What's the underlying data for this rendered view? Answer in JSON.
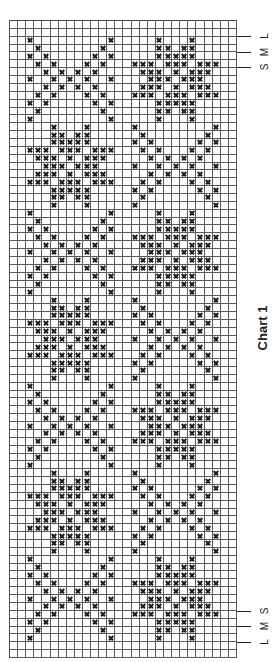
{
  "chart_data": {
    "type": "table",
    "title": "Chart 1",
    "grid": {
      "columns": 28,
      "rows": 81,
      "gridlines": true
    },
    "symbol": "x",
    "symbol_color": "#1e1e1e",
    "grid_color": "#5a5a5a",
    "size_markers": {
      "top": [
        {
          "label": "L",
          "row_boundary": 2
        },
        {
          "label": "M",
          "row_boundary": 4
        },
        {
          "label": "S",
          "row_boundary": 6
        }
      ],
      "bottom": [
        {
          "label": "S",
          "row_boundary": 75
        },
        {
          "label": "M",
          "row_boundary": 77
        },
        {
          "label": "L",
          "row_boundary": 79
        }
      ]
    },
    "motifs": {
      "lattice": [
        [
          0,
          10
        ],
        [
          1,
          9
        ],
        [
          0,
          2,
          8,
          10
        ],
        [
          1,
          3,
          7,
          9
        ],
        [
          2,
          4,
          6,
          8
        ],
        [
          0,
          3,
          5,
          7,
          10
        ],
        [
          2,
          4,
          6,
          8
        ],
        [
          1,
          3,
          7,
          9
        ],
        [
          0,
          2,
          8,
          10
        ],
        [
          1,
          9
        ],
        [
          0,
          10
        ]
      ],
      "star": [
        [
          3,
          7
        ],
        [
          3,
          4,
          6,
          7
        ],
        [
          3,
          4,
          5,
          6,
          7
        ],
        [
          0,
          1,
          2,
          4,
          5,
          6,
          8,
          9,
          10
        ],
        [
          1,
          2,
          3,
          5,
          7,
          8,
          9
        ],
        [
          2,
          3,
          4,
          6,
          7,
          8
        ],
        [
          1,
          2,
          3,
          5,
          7,
          8,
          9
        ],
        [
          0,
          1,
          2,
          4,
          5,
          6,
          8,
          9,
          10
        ],
        [
          3,
          4,
          5,
          6,
          7
        ],
        [
          3,
          4,
          6,
          7
        ],
        [
          3,
          7
        ]
      ]
    },
    "blocks": [
      {
        "start_row": 2,
        "left": "lattice",
        "right": "star"
      },
      {
        "start_row": 13,
        "left": "star",
        "right": "lattice"
      },
      {
        "start_row": 24,
        "left": "lattice",
        "right": "star"
      },
      {
        "start_row": 35,
        "left": "star",
        "right": "lattice"
      },
      {
        "start_row": 46,
        "left": "lattice",
        "right": "star"
      },
      {
        "start_row": 57,
        "left": "star",
        "right": "lattice"
      },
      {
        "start_row": 68,
        "left": "lattice",
        "right": "star"
      }
    ],
    "motif_left_col": 2,
    "motif_right_col": 15,
    "rows_marked": {
      "block_lattice_left": [
        [
          2,
          12,
          18,
          22
        ],
        [
          3,
          11,
          18,
          19,
          21,
          22
        ],
        [
          2,
          4,
          10,
          12,
          18,
          19,
          20,
          21,
          22
        ],
        [
          3,
          5,
          9,
          11,
          15,
          16,
          17,
          19,
          20,
          21,
          23,
          24,
          25
        ],
        [
          4,
          6,
          8,
          10,
          16,
          17,
          18,
          20,
          22,
          23,
          24
        ],
        [
          2,
          5,
          7,
          9,
          12,
          17,
          18,
          19,
          21,
          22,
          23
        ],
        [
          4,
          6,
          8,
          10,
          16,
          17,
          18,
          20,
          22,
          23,
          24
        ],
        [
          3,
          5,
          9,
          11,
          15,
          16,
          17,
          19,
          20,
          21,
          23,
          24,
          25
        ],
        [
          2,
          4,
          10,
          12,
          18,
          19,
          20,
          21,
          22
        ],
        [
          3,
          11,
          18,
          19,
          21,
          22
        ],
        [
          2,
          12,
          18,
          22
        ]
      ],
      "block_star_left": [
        [
          5,
          9,
          15,
          25
        ],
        [
          5,
          6,
          8,
          9,
          16,
          24
        ],
        [
          5,
          6,
          7,
          8,
          9,
          15,
          17,
          23,
          25
        ],
        [
          2,
          3,
          4,
          6,
          7,
          8,
          10,
          11,
          12,
          16,
          18,
          22,
          24
        ],
        [
          3,
          4,
          5,
          7,
          9,
          10,
          11,
          17,
          19,
          21,
          23
        ],
        [
          4,
          5,
          6,
          8,
          9,
          10,
          15,
          18,
          20,
          22,
          25
        ],
        [
          3,
          4,
          5,
          7,
          9,
          10,
          11,
          17,
          19,
          21,
          23
        ],
        [
          2,
          3,
          4,
          6,
          7,
          8,
          10,
          11,
          12,
          16,
          18,
          22,
          24
        ],
        [
          5,
          6,
          7,
          8,
          9,
          15,
          17,
          23,
          25
        ],
        [
          5,
          6,
          8,
          9,
          16,
          24
        ],
        [
          5,
          9,
          15,
          25
        ]
      ]
    },
    "empty_rows": [
      0,
      1,
      79,
      80
    ]
  }
}
